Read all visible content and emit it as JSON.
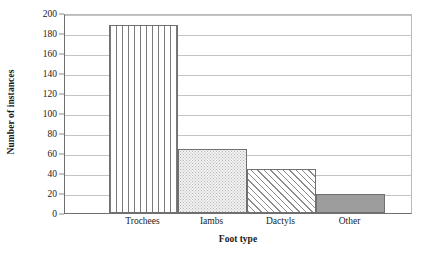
{
  "chart_data": {
    "type": "bar",
    "title": "",
    "xlabel": "Foot type",
    "ylabel": "Number of instances",
    "categories": [
      "Trochees",
      "Iambs",
      "Dactyls",
      "Other"
    ],
    "values": [
      188,
      64,
      44,
      19
    ],
    "series": [
      {
        "name": "Number of instances",
        "values": [
          188,
          64,
          44,
          19
        ]
      }
    ],
    "ylim": [
      0,
      200
    ],
    "ytick_values": [
      0,
      20,
      40,
      60,
      80,
      100,
      120,
      140,
      160,
      180,
      200
    ],
    "ytick_labels": [
      "0",
      "20",
      "40",
      "60",
      "80",
      "100",
      "120",
      "140",
      "160",
      "180",
      "200"
    ],
    "grid": "horizontal",
    "legend": "none",
    "bar_fills": [
      "vertical-stripes",
      "light-dots",
      "diagonal-hatch",
      "solid-gray"
    ],
    "colors": {
      "axis": "#6e6e6e",
      "gridline": "#c4c4c4",
      "bar_outline": "#707070",
      "solid_bar": "#9d9d9d",
      "dotted_bar": "#f2f2f2",
      "background": "#ffffff",
      "text": "#1a1a1a"
    }
  }
}
